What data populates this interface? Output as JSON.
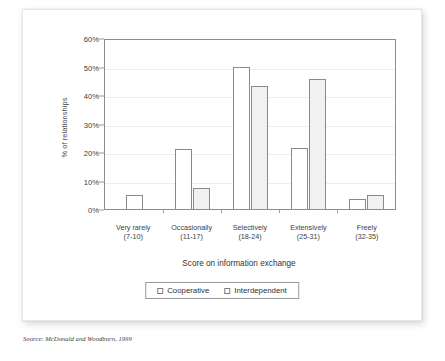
{
  "chart_data": {
    "type": "bar",
    "title": "",
    "xlabel": "Score on information exchange",
    "ylabel": "% of relationships",
    "ylim": [
      0,
      60
    ],
    "yticks": [
      "0%",
      "10%",
      "20%",
      "30%",
      "40%",
      "50%",
      "60%"
    ],
    "ytick_values": [
      0,
      10,
      20,
      30,
      40,
      50,
      60
    ],
    "grid": true,
    "legend_position": "bottom",
    "categories": [
      "Very rarely",
      "Occasionally",
      "Selectively",
      "Extensively",
      "Freely"
    ],
    "category_ranges": [
      "(7-10)",
      "(11-17)",
      "(18-24)",
      "(25-31)",
      "(32-35)"
    ],
    "series": [
      {
        "name": "Cooperative",
        "color": "#ffffff",
        "values": [
          5,
          21,
          50,
          21.5,
          3.5
        ]
      },
      {
        "name": "Interdependent",
        "color": "#f1f1f1",
        "values": [
          0,
          7.5,
          43,
          45.5,
          5
        ]
      }
    ]
  },
  "source": {
    "note": "Source: McDonald and Woodburn, 1999"
  },
  "colors": {
    "bar_outline": "#8a8a8a",
    "frame": "#8d8d8d",
    "gridline": "#ededed",
    "coop_fill": "#ffffff",
    "inter_fill": "#f1f1f1"
  }
}
